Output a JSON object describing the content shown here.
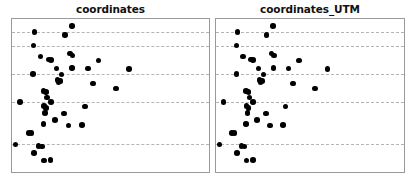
{
  "figure": {
    "width": 416,
    "height": 183,
    "background_color": "#ffffff",
    "panel_border_color": "#9a9a9a",
    "gridline_color": "#b4b4b4",
    "point_color": "#000000"
  },
  "panels": [
    {
      "id": "coordinates",
      "title": "coordinates",
      "left_px": 11,
      "width_px": 199
    },
    {
      "id": "coordinates_UTM",
      "title": "coordinates_UTM",
      "left_px": 215,
      "width_px": 190
    }
  ],
  "chart_data": [
    {
      "type": "scatter",
      "title": "coordinates",
      "xlabel": "",
      "ylabel": "",
      "xlim": [
        0,
        1
      ],
      "ylim": [
        0,
        1
      ],
      "grid": true,
      "grid_orientation": "horizontal",
      "gridlines_y": [
        0.915,
        0.826,
        0.639,
        0.458,
        0.181
      ],
      "legend": null,
      "marker": "circle",
      "marker_color": "#000000",
      "marker_size_px": 5.6,
      "points": [
        {
          "x": 0.114,
          "y": 0.915
        },
        {
          "x": 0.304,
          "y": 0.955
        },
        {
          "x": 0.268,
          "y": 0.895
        },
        {
          "x": 0.11,
          "y": 0.826
        },
        {
          "x": 0.145,
          "y": 0.755
        },
        {
          "x": 0.186,
          "y": 0.735
        },
        {
          "x": 0.197,
          "y": 0.731
        },
        {
          "x": 0.295,
          "y": 0.775
        },
        {
          "x": 0.307,
          "y": 0.762
        },
        {
          "x": 0.44,
          "y": 0.728
        },
        {
          "x": 0.108,
          "y": 0.639
        },
        {
          "x": 0.225,
          "y": 0.676
        },
        {
          "x": 0.252,
          "y": 0.638
        },
        {
          "x": 0.305,
          "y": 0.678
        },
        {
          "x": 0.385,
          "y": 0.676
        },
        {
          "x": 0.593,
          "y": 0.672
        },
        {
          "x": 0.231,
          "y": 0.603
        },
        {
          "x": 0.236,
          "y": 0.589
        },
        {
          "x": 0.246,
          "y": 0.594
        },
        {
          "x": 0.41,
          "y": 0.578
        },
        {
          "x": 0.528,
          "y": 0.546
        },
        {
          "x": 0.16,
          "y": 0.53
        },
        {
          "x": 0.172,
          "y": 0.522
        },
        {
          "x": 0.178,
          "y": 0.487
        },
        {
          "x": 0.04,
          "y": 0.458
        },
        {
          "x": 0.197,
          "y": 0.456
        },
        {
          "x": 0.163,
          "y": 0.43
        },
        {
          "x": 0.173,
          "y": 0.418
        },
        {
          "x": 0.37,
          "y": 0.428
        },
        {
          "x": 0.168,
          "y": 0.384
        },
        {
          "x": 0.265,
          "y": 0.382
        },
        {
          "x": 0.218,
          "y": 0.339
        },
        {
          "x": 0.159,
          "y": 0.313
        },
        {
          "x": 0.287,
          "y": 0.305
        },
        {
          "x": 0.355,
          "y": 0.306
        },
        {
          "x": 0.085,
          "y": 0.256
        },
        {
          "x": 0.098,
          "y": 0.254
        },
        {
          "x": 0.018,
          "y": 0.181
        },
        {
          "x": 0.135,
          "y": 0.168
        },
        {
          "x": 0.152,
          "y": 0.166
        },
        {
          "x": 0.113,
          "y": 0.124
        },
        {
          "x": 0.163,
          "y": 0.075
        },
        {
          "x": 0.196,
          "y": 0.078
        }
      ]
    },
    {
      "type": "scatter",
      "title": "coordinates_UTM",
      "xlabel": "",
      "ylabel": "",
      "xlim": [
        0,
        1
      ],
      "ylim": [
        0,
        1
      ],
      "grid": true,
      "grid_orientation": "horizontal",
      "gridlines_y": [
        0.915,
        0.826,
        0.639,
        0.458,
        0.181
      ],
      "legend": null,
      "marker": "circle",
      "marker_color": "#000000",
      "marker_size_px": 5.6,
      "points": [
        {
          "x": 0.114,
          "y": 0.915
        },
        {
          "x": 0.304,
          "y": 0.955
        },
        {
          "x": 0.268,
          "y": 0.895
        },
        {
          "x": 0.11,
          "y": 0.826
        },
        {
          "x": 0.145,
          "y": 0.755
        },
        {
          "x": 0.186,
          "y": 0.735
        },
        {
          "x": 0.197,
          "y": 0.731
        },
        {
          "x": 0.295,
          "y": 0.775
        },
        {
          "x": 0.307,
          "y": 0.762
        },
        {
          "x": 0.44,
          "y": 0.728
        },
        {
          "x": 0.108,
          "y": 0.639
        },
        {
          "x": 0.225,
          "y": 0.676
        },
        {
          "x": 0.252,
          "y": 0.638
        },
        {
          "x": 0.305,
          "y": 0.678
        },
        {
          "x": 0.385,
          "y": 0.676
        },
        {
          "x": 0.593,
          "y": 0.672
        },
        {
          "x": 0.231,
          "y": 0.603
        },
        {
          "x": 0.236,
          "y": 0.589
        },
        {
          "x": 0.246,
          "y": 0.594
        },
        {
          "x": 0.41,
          "y": 0.578
        },
        {
          "x": 0.528,
          "y": 0.546
        },
        {
          "x": 0.16,
          "y": 0.53
        },
        {
          "x": 0.172,
          "y": 0.522
        },
        {
          "x": 0.178,
          "y": 0.487
        },
        {
          "x": 0.04,
          "y": 0.458
        },
        {
          "x": 0.197,
          "y": 0.456
        },
        {
          "x": 0.163,
          "y": 0.43
        },
        {
          "x": 0.173,
          "y": 0.418
        },
        {
          "x": 0.37,
          "y": 0.428
        },
        {
          "x": 0.168,
          "y": 0.384
        },
        {
          "x": 0.265,
          "y": 0.382
        },
        {
          "x": 0.218,
          "y": 0.339
        },
        {
          "x": 0.159,
          "y": 0.313
        },
        {
          "x": 0.287,
          "y": 0.305
        },
        {
          "x": 0.355,
          "y": 0.306
        },
        {
          "x": 0.085,
          "y": 0.256
        },
        {
          "x": 0.098,
          "y": 0.254
        },
        {
          "x": 0.018,
          "y": 0.181
        },
        {
          "x": 0.135,
          "y": 0.168
        },
        {
          "x": 0.152,
          "y": 0.166
        },
        {
          "x": 0.113,
          "y": 0.124
        },
        {
          "x": 0.163,
          "y": 0.075
        },
        {
          "x": 0.196,
          "y": 0.078
        }
      ]
    }
  ]
}
